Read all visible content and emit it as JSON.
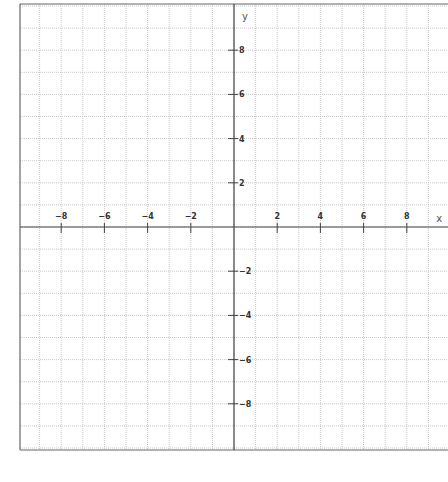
{
  "chart_data": {
    "type": "scatter",
    "title": "",
    "xlabel": "x",
    "ylabel": "y",
    "xlim": [
      -10,
      10
    ],
    "ylim": [
      -10,
      10
    ],
    "grid": true,
    "grid_step": 1,
    "x_ticks": [
      -8,
      -6,
      -4,
      -2,
      2,
      4,
      6,
      8
    ],
    "y_ticks": [
      8,
      6,
      4,
      2,
      -2,
      -4,
      -6,
      -8
    ],
    "x_tick_labels": [
      "−8",
      "−6",
      "−4",
      "−2",
      "2",
      "4",
      "6",
      "8"
    ],
    "y_tick_labels": [
      "8",
      "6",
      "4",
      "2",
      "−2",
      "−4",
      "−6",
      "−8"
    ],
    "series": [],
    "legend": null
  },
  "layout": {
    "origin_px": [
      234,
      227
    ],
    "unit_x_px": 21.6,
    "unit_y_px": 22.1,
    "frame": {
      "left": 20,
      "top": 4,
      "right": 448,
      "bottom": 450
    },
    "colors": {
      "axis": "#444444",
      "frame": "#666666",
      "grid": "#c8c8c8",
      "tick_label": "#333333"
    }
  }
}
